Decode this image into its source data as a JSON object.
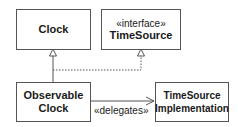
{
  "diagram": {
    "type": "uml-class-diagram",
    "classes": [
      {
        "id": "clock",
        "name": "Clock"
      },
      {
        "id": "timesource",
        "stereotype": "«interface»",
        "name": "TimeSource"
      },
      {
        "id": "observable_clock",
        "name_line1": "Observable",
        "name_line2": "Clock"
      },
      {
        "id": "timesource_impl",
        "name_line1": "TimeSource",
        "name_line2": "Implementation"
      }
    ],
    "relations": [
      {
        "from": "Observable Clock",
        "to": "Clock",
        "kind": "generalization"
      },
      {
        "from": "Observable Clock",
        "to": "TimeSource",
        "kind": "realization"
      },
      {
        "from": "Observable Clock",
        "to": "TimeSource Implementation",
        "kind": "dependency",
        "label": "«delegates»"
      }
    ],
    "colors": {
      "line": "#555555",
      "text": "#1a1a1a",
      "background": "#ffffff"
    }
  }
}
